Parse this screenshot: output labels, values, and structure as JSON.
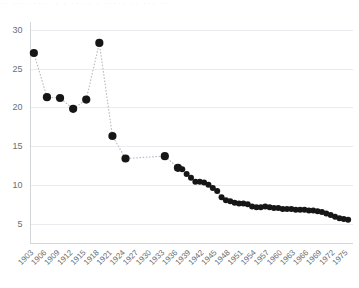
{
  "top_clipped_text": "··  ····   ···· ·  ·  ·· ·· ·   ····· ·· ···  ··",
  "chart_data": {
    "type": "scatter",
    "title": "",
    "subtitle": "",
    "xlabel": "",
    "ylabel": "",
    "xlim": [
      1902,
      1976
    ],
    "ylim": [
      2.5,
      31
    ],
    "grid": true,
    "legend": null,
    "marker_color": "#161616",
    "connector_color": "#b9bcc0",
    "connector_style": "dotted",
    "gridline_color": "#e9ebee",
    "axis_color": "#d4d7da",
    "ytick_values": [
      5,
      10,
      15,
      20,
      25,
      30
    ],
    "ytick_labels": [
      "5",
      "10",
      "15",
      "20",
      "25",
      "30"
    ],
    "xtick_values": [
      1903,
      1906,
      1909,
      1912,
      1915,
      1918,
      1921,
      1924,
      1927,
      1930,
      1933,
      1936,
      1939,
      1942,
      1945,
      1948,
      1951,
      1954,
      1957,
      1960,
      1963,
      1966,
      1969,
      1972,
      1975
    ],
    "xtick_labels": [
      "1903",
      "1906",
      "1909",
      "1912",
      "1915",
      "1918",
      "1921",
      "1924",
      "1927",
      "1930",
      "1933",
      "1936",
      "1939",
      "1942",
      "1945",
      "1948",
      "1951",
      "1954",
      "1957",
      "1960",
      "1963",
      "1966",
      "1969",
      "1972",
      "1975"
    ],
    "xtick_rotation": -45,
    "x": [
      1903,
      1906,
      1909,
      1912,
      1915,
      1918,
      1921,
      1924,
      1933,
      1936,
      1937,
      1938,
      1939,
      1940,
      1941,
      1942,
      1943,
      1944,
      1945,
      1946,
      1947,
      1948,
      1949,
      1950,
      1951,
      1952,
      1953,
      1954,
      1955,
      1956,
      1957,
      1958,
      1959,
      1960,
      1961,
      1962,
      1963,
      1964,
      1965,
      1966,
      1967,
      1968,
      1969,
      1970,
      1971,
      1972,
      1973,
      1974,
      1975
    ],
    "y": [
      27.0,
      21.3,
      21.2,
      19.8,
      21.0,
      28.3,
      16.3,
      13.4,
      13.7,
      12.2,
      12.0,
      11.4,
      10.9,
      10.4,
      10.4,
      10.3,
      10.0,
      9.6,
      9.2,
      8.4,
      8.0,
      7.9,
      7.7,
      7.6,
      7.6,
      7.5,
      7.2,
      7.1,
      7.1,
      7.2,
      7.1,
      7.0,
      7.0,
      6.9,
      6.9,
      6.9,
      6.8,
      6.8,
      6.8,
      6.7,
      6.7,
      6.6,
      6.5,
      6.3,
      6.1,
      5.9,
      5.7,
      5.6,
      5.5
    ],
    "annotations": []
  }
}
